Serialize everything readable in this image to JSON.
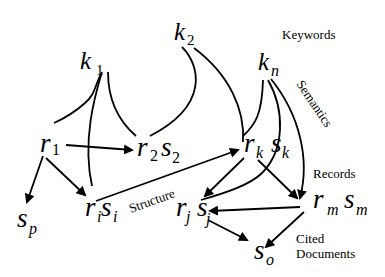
{
  "diagram": {
    "nodes": {
      "k1": {
        "base": "k",
        "sub": "1"
      },
      "k2": {
        "base": "k",
        "sub": "2"
      },
      "kn": {
        "base": "k",
        "sub": "n"
      },
      "r1": {
        "base": "r",
        "sub": "1"
      },
      "r2s2": {
        "r": "r",
        "r_sub": "2",
        "s": "s",
        "s_sub": "2"
      },
      "rksk": {
        "r": "r",
        "r_sub": "k",
        "s": "s",
        "s_sub": "k"
      },
      "risi": {
        "r": "r",
        "r_sub": "i",
        "s": "s",
        "s_sub": "i"
      },
      "rjsj": {
        "r": "r",
        "r_sub": "j",
        "s": "s",
        "s_sub": "j"
      },
      "rmsm": {
        "r": "r",
        "r_sub": "m",
        "s": "s",
        "s_sub": "m"
      },
      "sp": {
        "base": "s",
        "sub": "p"
      },
      "so": {
        "base": "s",
        "sub": "o"
      }
    },
    "labels": {
      "keywords": "Keywords",
      "semantics": "Semantics",
      "records": "Records",
      "structure": "Structure",
      "cited_line1": "Cited",
      "cited_line2": "Documents"
    },
    "edges": [
      {
        "from": "k1",
        "to": "r1",
        "type": "line"
      },
      {
        "from": "k1",
        "to": "risi",
        "type": "line"
      },
      {
        "from": "k1",
        "to": "r2s2",
        "type": "line"
      },
      {
        "from": "k2",
        "to": "r2s2",
        "type": "line"
      },
      {
        "from": "k2",
        "to": "rksk",
        "type": "line"
      },
      {
        "from": "kn",
        "to": "rksk",
        "type": "line"
      },
      {
        "from": "kn",
        "to": "rjsj",
        "type": "line"
      },
      {
        "from": "kn",
        "to": "rmsm",
        "type": "arrow"
      },
      {
        "from": "r1",
        "to": "r2s2",
        "type": "arrow"
      },
      {
        "from": "r1",
        "to": "sp",
        "type": "arrow"
      },
      {
        "from": "r1",
        "to": "risi",
        "type": "arrow"
      },
      {
        "from": "risi",
        "to": "rksk",
        "type": "arrow"
      },
      {
        "from": "rksk",
        "to": "rjsj",
        "type": "arrow"
      },
      {
        "from": "rksk",
        "to": "rmsm",
        "type": "arrow"
      },
      {
        "from": "rmsm",
        "to": "rjsj",
        "type": "arrow"
      },
      {
        "from": "rjsj",
        "to": "so",
        "type": "arrow"
      },
      {
        "from": "rmsm",
        "to": "so",
        "type": "arrow"
      }
    ]
  }
}
